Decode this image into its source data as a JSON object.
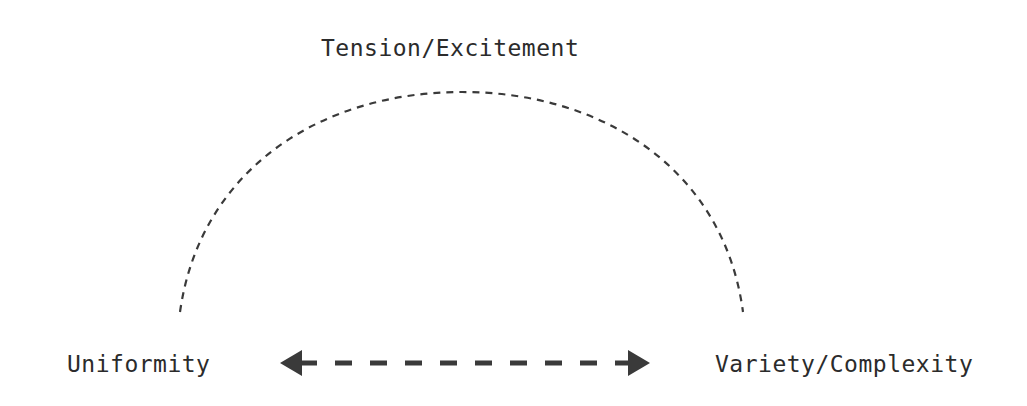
{
  "diagram": {
    "top_label": "Tension/Excitement",
    "left_label": "Uniformity",
    "right_label": "Variety/Complexity",
    "colors": {
      "stroke": "#3a3a3a",
      "text": "#2b2b2b",
      "background": "#ffffff"
    },
    "arc": {
      "style": "dashed",
      "from": "left",
      "to": "right",
      "apex": "top"
    },
    "arrow": {
      "style": "dashed",
      "direction": "bidirectional"
    }
  }
}
